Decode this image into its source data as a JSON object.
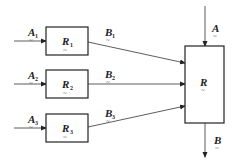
{
  "diagram": {
    "small_blocks": [
      {
        "id": "R1",
        "label": "R",
        "sub": "1",
        "input_label": "A",
        "input_sub": "1",
        "output_label": "B",
        "output_sub": "1"
      },
      {
        "id": "R2",
        "label": "R",
        "sub": "2",
        "input_label": "A",
        "input_sub": "2",
        "output_label": "B",
        "output_sub": "2"
      },
      {
        "id": "R3",
        "label": "R",
        "sub": "3",
        "input_label": "A",
        "input_sub": "3",
        "output_label": "B",
        "output_sub": "3"
      }
    ],
    "main_block": {
      "label": "R",
      "input_label": "A",
      "output_label": "B"
    },
    "tilde": "~",
    "colors": {
      "line": "#333333",
      "text": "#222222"
    }
  }
}
